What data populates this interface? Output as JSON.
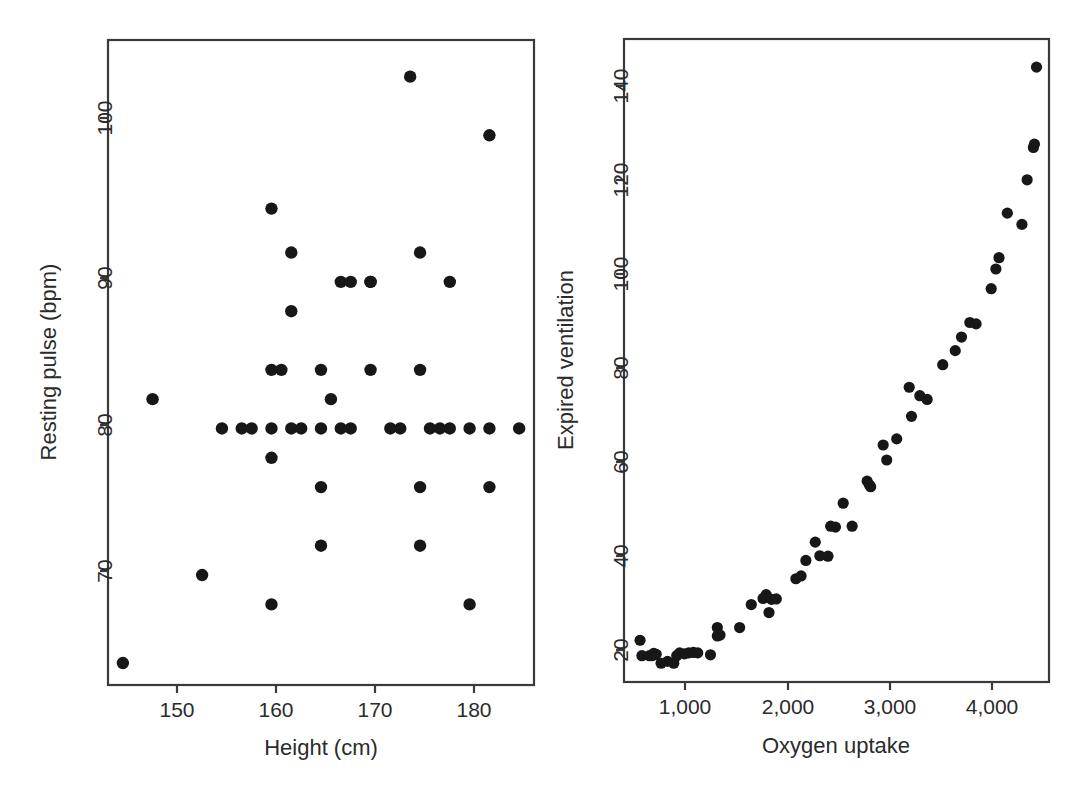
{
  "figure": {
    "background": "#ffffff",
    "point_color": "#171717",
    "axis_color": "#3a3a3a",
    "panels": [
      "left-scatter-panel",
      "right-scatter-panel"
    ]
  },
  "chart_data": [
    {
      "type": "scatter",
      "name": "height-vs-resting-pulse",
      "title": "",
      "xlabel": "Height (cm)",
      "ylabel": "Resting pulse (bpm)",
      "xticks": [
        150,
        160,
        170,
        180
      ],
      "xtick_labels": [
        "150",
        "160",
        "170",
        "180"
      ],
      "yticks": [
        70,
        80,
        90,
        100
      ],
      "ytick_labels": [
        "70",
        "80",
        "90",
        "100"
      ],
      "xlim": [
        143.5,
        186.5
      ],
      "ylim": [
        62.5,
        106.5
      ],
      "grid": false,
      "legend": "none",
      "x": [
        145,
        148,
        153,
        155,
        157,
        158,
        160,
        160,
        160,
        160,
        160,
        161,
        162,
        162,
        162,
        163,
        165,
        165,
        165,
        165,
        166,
        167,
        167,
        168,
        168,
        170,
        170,
        170,
        172,
        173,
        174,
        175,
        175,
        175,
        175,
        176,
        177,
        178,
        178,
        180,
        180,
        182,
        182,
        182,
        185
      ],
      "y": [
        64,
        82,
        70,
        80,
        80,
        80,
        68,
        78,
        80,
        84,
        95,
        84,
        80,
        88,
        92,
        80,
        72,
        76,
        80,
        84,
        82,
        80,
        90,
        80,
        90,
        84,
        90,
        90,
        80,
        80,
        104,
        72,
        76,
        84,
        92,
        80,
        80,
        80,
        90,
        68,
        80,
        76,
        80,
        100,
        80
      ]
    },
    {
      "type": "scatter",
      "name": "oxygen-uptake-vs-expired-ventilation",
      "title": "",
      "xlabel": "Oxygen uptake",
      "ylabel": "Expired ventilation",
      "xticks": [
        1000,
        2000,
        3000,
        4000
      ],
      "xtick_labels": [
        "1,000",
        "2,000",
        "3,000",
        "4,000"
      ],
      "yticks": [
        20,
        40,
        60,
        80,
        100,
        120,
        140
      ],
      "ytick_labels": [
        "20",
        "40",
        "60",
        "80",
        "100",
        "120",
        "140"
      ],
      "xlim": [
        420,
        4500
      ],
      "ylim": [
        13,
        150
      ],
      "grid": false,
      "legend": "none",
      "x": [
        574,
        592,
        664,
        690,
        705,
        729,
        776,
        838,
        898,
        926,
        954,
        1001,
        1042,
        1086,
        1128,
        1250,
        1316,
        1316,
        1342,
        1530,
        1642,
        1755,
        1785,
        1812,
        1836,
        1882,
        2070,
        2120,
        2166,
        2256,
        2300,
        2378,
        2404,
        2450,
        2524,
        2610,
        2754,
        2776,
        2788,
        2908,
        2942,
        3038,
        3158,
        3180,
        3260,
        3330,
        3480,
        3600,
        3660,
        3740,
        3800,
        3945,
        3990,
        4020,
        4100,
        4240,
        4290,
        4350,
        4360,
        4380
      ],
      "y": [
        21.9,
        18.6,
        18.6,
        18.6,
        19.1,
        18.9,
        17.0,
        17.4,
        17.0,
        18.6,
        19.2,
        19.0,
        19.2,
        19.3,
        19.2,
        18.8,
        22.8,
        24.6,
        23.0,
        24.6,
        29.5,
        30.8,
        31.6,
        27.8,
        30.6,
        30.7,
        35.0,
        35.6,
        38.9,
        42.8,
        39.9,
        39.8,
        46.2,
        46.0,
        51.1,
        46.2,
        55.8,
        55.0,
        54.6,
        63.5,
        60.3,
        64.8,
        75.8,
        69.6,
        74.0,
        73.2,
        80.6,
        83.6,
        86.5,
        89.6,
        89.3,
        96.8,
        101.0,
        103.4,
        112.9,
        110.5,
        120.0,
        126.9,
        127.6,
        144.0,
        143.0,
        139.0,
        135.7
      ]
    }
  ]
}
